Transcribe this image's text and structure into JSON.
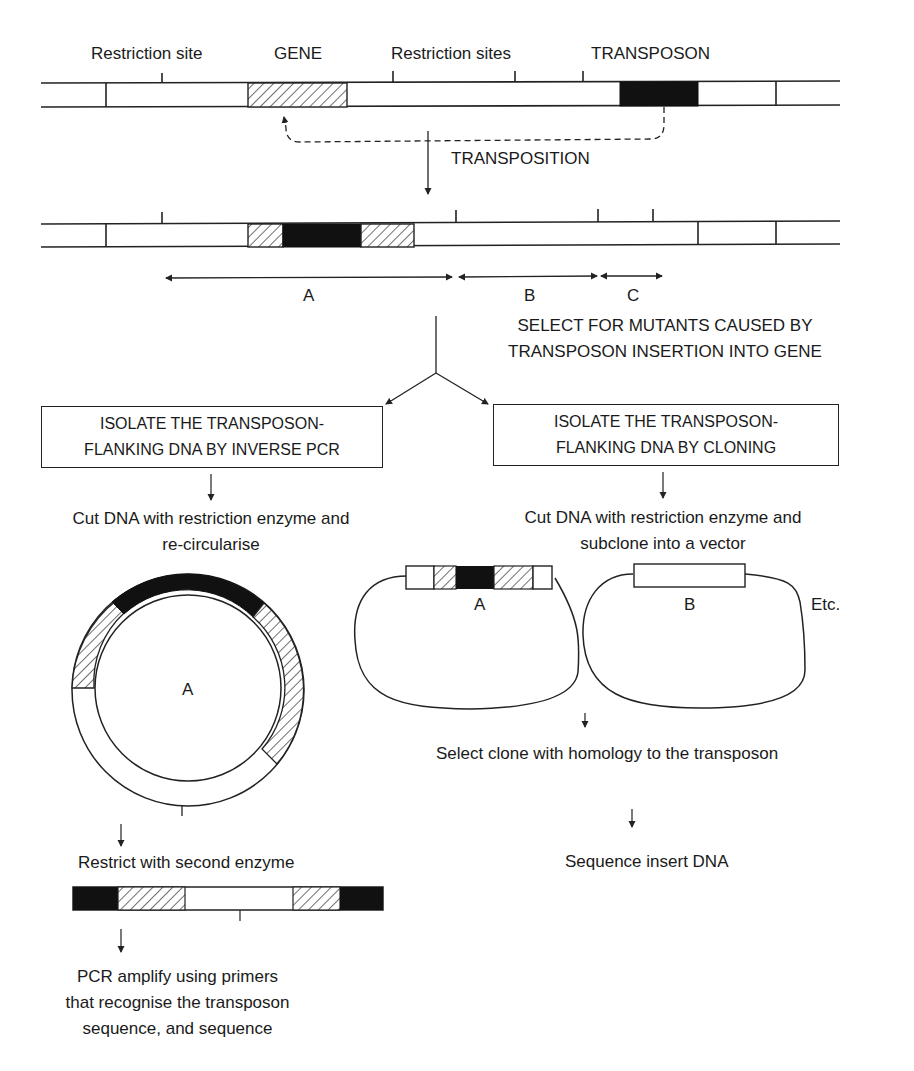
{
  "top_chromosome": {
    "labels": {
      "restriction_site": "Restriction site",
      "gene": "GENE",
      "restriction_sites": "Restriction sites",
      "transposon": "TRANSPOSON"
    },
    "transposition_label": "TRANSPOSITION"
  },
  "mutant_chromosome": {
    "fragments": [
      {
        "label": "A"
      },
      {
        "label": "B"
      },
      {
        "label": "C"
      }
    ]
  },
  "selection_step": {
    "line1": "SELECT FOR MUTANTS CAUSED BY",
    "line2": "TRANSPOSON INSERTION INTO GENE"
  },
  "left_branch": {
    "box_line1": "ISOLATE THE TRANSPOSON-",
    "box_line2": "FLANKING DNA BY INVERSE PCR",
    "step1_line1": "Cut DNA with restriction enzyme and",
    "step1_line2": "re-circularise",
    "circle_label": "A",
    "step2": "Restrict with second enzyme",
    "step3_line1": "PCR amplify using primers",
    "step3_line2": "that recognise the transposon",
    "step3_line3": "sequence, and sequence"
  },
  "right_branch": {
    "box_line1": "ISOLATE THE TRANSPOSON-",
    "box_line2": "FLANKING DNA BY CLONING",
    "step1_line1": "Cut DNA with restriction enzyme and",
    "step1_line2": "subclone into a vector",
    "clone_a_label": "A",
    "clone_b_label": "B",
    "etc_label": "Etc.",
    "step2": "Select clone with homology to the transposon",
    "step3": "Sequence insert DNA"
  },
  "legend_colors": {
    "transposon_fill": "#111111",
    "gene_fill": "hatched",
    "dna_fill": "#ffffff",
    "line": "#222222"
  }
}
